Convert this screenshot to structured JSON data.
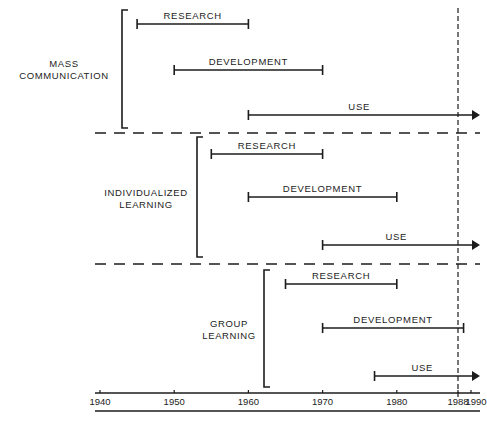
{
  "diagram": {
    "type": "timeline",
    "axis": {
      "ticks": [
        {
          "year": 1940,
          "label": "1940"
        },
        {
          "year": 1950,
          "label": "1950"
        },
        {
          "year": 1960,
          "label": "1960"
        },
        {
          "year": 1970,
          "label": "1970"
        },
        {
          "year": 1980,
          "label": "1980"
        },
        {
          "year": 1988,
          "label": "1988"
        },
        {
          "year": 1990,
          "label": "1990"
        }
      ],
      "current_year_marker": 1988
    },
    "groups": [
      {
        "label_line1": "MASS",
        "label_line2": "COMMUNICATION",
        "phases": [
          {
            "label": "RESEARCH",
            "start": 1945,
            "end": 1960,
            "ongoing": false
          },
          {
            "label": "DEVELOPMENT",
            "start": 1950,
            "end": 1970,
            "ongoing": false
          },
          {
            "label": "USE",
            "start": 1960,
            "end": null,
            "ongoing": true
          }
        ]
      },
      {
        "label_line1": "INDIVIDUALIZED",
        "label_line2": "LEARNING",
        "phases": [
          {
            "label": "RESEARCH",
            "start": 1955,
            "end": 1970,
            "ongoing": false
          },
          {
            "label": "DEVELOPMENT",
            "start": 1960,
            "end": 1980,
            "ongoing": false
          },
          {
            "label": "USE",
            "start": 1970,
            "end": null,
            "ongoing": true
          }
        ]
      },
      {
        "label_line1": "GROUP",
        "label_line2": "LEARNING",
        "phases": [
          {
            "label": "RESEARCH",
            "start": 1965,
            "end": 1980,
            "ongoing": false
          },
          {
            "label": "DEVELOPMENT",
            "start": 1970,
            "end": 1989,
            "ongoing": false
          },
          {
            "label": "USE",
            "start": 1977,
            "end": null,
            "ongoing": true
          }
        ]
      }
    ]
  },
  "style": {
    "ink": "#1c1c1c",
    "background": "#ffffff"
  }
}
